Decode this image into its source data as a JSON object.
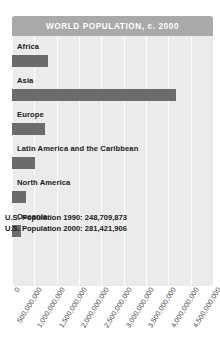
{
  "chart_data": {
    "type": "bar",
    "orientation": "horizontal",
    "title": "WORLD POPULATION, c. 2000",
    "xlabel": "",
    "ylabel": "",
    "categories": [
      "Africa",
      "Asia",
      "Europe",
      "Latin America and the Caribbean",
      "North America",
      "Oceania"
    ],
    "values": [
      796000000,
      3680000000,
      729000000,
      520000000,
      310000000,
      200000000
    ],
    "xlim": [
      0,
      4500000000
    ],
    "tick_labels": [
      "0",
      "500,000,000",
      "1,000,000,000",
      "1,500,000,000",
      "2,000,000,000",
      "2,500,000,000",
      "3,000,000,000",
      "3,500,000,000",
      "4,000,000,000",
      "4,500,000,000"
    ],
    "tick_values": [
      0,
      500000000,
      1000000000,
      1500000000,
      2000000000,
      2500000000,
      3000000000,
      3500000000,
      4000000000,
      4500000000
    ],
    "grid": true,
    "legend": "none",
    "annotations": [
      "U.S. Population 1990: 248,709,873",
      "U.S. Population 2000: 281,421,906"
    ],
    "colors": {
      "bar": "#6b6b6b",
      "plot_background": "#ebebeb",
      "title_bar": "#a9a9a9",
      "title_text": "#ffffff",
      "gridline": "#fdfdfd",
      "label_text": "#1a1a1a",
      "page_background": "#ffffff"
    }
  }
}
